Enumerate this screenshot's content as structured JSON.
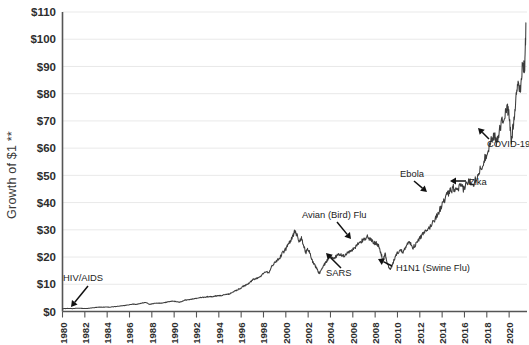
{
  "chart_data": {
    "type": "line",
    "title": "",
    "xlabel": "",
    "ylabel": "Growth of $1 **",
    "xlim": [
      1980,
      2021.6
    ],
    "ylim": [
      0,
      110
    ],
    "grid": true,
    "legend": "none",
    "y_tick_labels": [
      "$0",
      "$10",
      "$20",
      "$30",
      "$40",
      "$50",
      "$60",
      "$70",
      "$80",
      "$90",
      "$100",
      "$110"
    ],
    "y_tick_values": [
      0,
      10,
      20,
      30,
      40,
      50,
      60,
      70,
      80,
      90,
      100,
      110
    ],
    "x_tick_labels": [
      "1980",
      "1982",
      "1984",
      "1986",
      "1988",
      "1990",
      "1992",
      "1994",
      "1996",
      "1998",
      "2000",
      "2002",
      "2004",
      "2006",
      "2008",
      "2010",
      "2012",
      "2014",
      "2016",
      "2018",
      "2020"
    ],
    "x_tick_values": [
      1980,
      1982,
      1984,
      1986,
      1988,
      1990,
      1992,
      1994,
      1996,
      1998,
      2000,
      2002,
      2004,
      2006,
      2008,
      2010,
      2012,
      2014,
      2016,
      2018,
      2020
    ],
    "series": [
      {
        "name": "Growth of $1",
        "x": [
          1980.0,
          1980.3,
          1980.6,
          1980.9,
          1981.2,
          1981.5,
          1981.8,
          1982.1,
          1982.4,
          1982.7,
          1983.0,
          1983.3,
          1983.6,
          1983.9,
          1984.2,
          1984.5,
          1984.8,
          1985.1,
          1985.4,
          1985.7,
          1986.0,
          1986.3,
          1986.6,
          1986.9,
          1987.2,
          1987.5,
          1987.8,
          1988.0,
          1988.3,
          1988.6,
          1988.9,
          1989.2,
          1989.5,
          1989.8,
          1990.1,
          1990.4,
          1990.7,
          1991.0,
          1991.3,
          1991.6,
          1991.9,
          1992.2,
          1992.5,
          1992.8,
          1993.1,
          1993.4,
          1993.7,
          1994.0,
          1994.3,
          1994.6,
          1994.9,
          1995.2,
          1995.5,
          1995.8,
          1996.1,
          1996.4,
          1996.7,
          1997.0,
          1997.3,
          1997.6,
          1997.9,
          1998.2,
          1998.5,
          1998.8,
          1999.1,
          1999.4,
          1999.7,
          2000.0,
          2000.2,
          2000.4,
          2000.6,
          2000.8,
          2001.0,
          2001.2,
          2001.4,
          2001.6,
          2001.8,
          2002.0,
          2002.2,
          2002.4,
          2002.6,
          2002.8,
          2003.0,
          2003.2,
          2003.4,
          2003.6,
          2003.8,
          2004.0,
          2004.3,
          2004.6,
          2004.9,
          2005.2,
          2005.5,
          2005.8,
          2006.1,
          2006.4,
          2006.7,
          2007.0,
          2007.3,
          2007.6,
          2007.9,
          2008.1,
          2008.3,
          2008.5,
          2008.7,
          2008.9,
          2009.1,
          2009.3,
          2009.5,
          2009.7,
          2009.9,
          2010.2,
          2010.5,
          2010.8,
          2011.1,
          2011.4,
          2011.7,
          2012.0,
          2012.3,
          2012.6,
          2012.9,
          2013.2,
          2013.5,
          2013.8,
          2014.1,
          2014.4,
          2014.7,
          2015.0,
          2015.3,
          2015.6,
          2015.9,
          2016.2,
          2016.5,
          2016.8,
          2017.1,
          2017.4,
          2017.7,
          2018.0,
          2018.3,
          2018.6,
          2018.9,
          2019.2,
          2019.5,
          2019.8,
          2020.0,
          2020.2,
          2020.4,
          2020.6,
          2020.8,
          2021.0,
          2021.2,
          2021.4,
          2021.5
        ],
        "y": [
          1.0,
          1.1,
          1.15,
          1.05,
          1.2,
          1.2,
          1.15,
          1.1,
          1.2,
          1.35,
          1.5,
          1.6,
          1.6,
          1.65,
          1.6,
          1.7,
          1.85,
          2.0,
          2.1,
          2.3,
          2.5,
          2.7,
          2.6,
          2.8,
          3.2,
          3.3,
          2.6,
          2.8,
          3.0,
          3.1,
          3.0,
          3.3,
          3.6,
          3.8,
          3.7,
          3.4,
          3.7,
          4.2,
          4.3,
          4.5,
          4.8,
          5.0,
          5.1,
          5.3,
          5.5,
          5.4,
          5.7,
          5.8,
          5.9,
          6.2,
          6.4,
          7.0,
          7.6,
          8.2,
          9.0,
          9.6,
          10.3,
          11.5,
          12.2,
          12.6,
          13.6,
          14.8,
          14.2,
          17.0,
          18.5,
          19.3,
          21.5,
          23.0,
          24.5,
          26.0,
          27.5,
          29.5,
          28.0,
          25.5,
          27.0,
          24.0,
          21.5,
          23.0,
          21.0,
          18.5,
          17.0,
          15.5,
          14.0,
          15.5,
          17.0,
          18.0,
          19.5,
          20.0,
          19.5,
          20.5,
          21.0,
          20.5,
          21.5,
          22.0,
          23.0,
          24.5,
          25.5,
          26.5,
          27.5,
          26.5,
          25.0,
          25.5,
          24.0,
          21.5,
          19.0,
          21.0,
          17.5,
          15.5,
          16.5,
          19.0,
          21.0,
          22.5,
          22.0,
          24.5,
          25.5,
          23.5,
          25.0,
          27.0,
          28.5,
          29.5,
          31.0,
          33.0,
          35.0,
          37.5,
          40.0,
          42.5,
          44.0,
          45.5,
          44.0,
          46.0,
          45.0,
          47.0,
          48.0,
          47.0,
          49.5,
          52.0,
          55.0,
          58.0,
          62.0,
          65.0,
          62.0,
          68.0,
          71.0,
          75.0,
          72.0,
          62.0,
          70.0,
          78.0,
          85.0,
          80.0,
          92.0,
          88.0,
          106.0
        ]
      }
    ],
    "annotations": [
      {
        "label": "HIV/AIDS",
        "text_x": 63,
        "text_y": 281,
        "arrow_x1": 88,
        "arrow_y1": 286,
        "arrow_x2": 71,
        "arrow_y2": 307
      },
      {
        "label": "SARS",
        "text_x": 326,
        "text_y": 276,
        "arrow_x1": 341,
        "arrow_y1": 268,
        "arrow_x2": 326,
        "arrow_y2": 253
      },
      {
        "label": "Avian (Bird) Flu",
        "text_x": 302,
        "text_y": 218,
        "arrow_x1": 337,
        "arrow_y1": 222,
        "arrow_x2": 351,
        "arrow_y2": 239
      },
      {
        "label": "H1N1 (Swine Flu)",
        "text_x": 396,
        "text_y": 271,
        "arrow_x1": 392,
        "arrow_y1": 266,
        "arrow_x2": 378,
        "arrow_y2": 259
      },
      {
        "label": "Ebola",
        "text_x": 400,
        "text_y": 177,
        "arrow_x1": 414,
        "arrow_y1": 181,
        "arrow_x2": 427,
        "arrow_y2": 192
      },
      {
        "label": "Zika",
        "text_x": 469,
        "text_y": 185,
        "arrow_x1": 466,
        "arrow_y1": 181,
        "arrow_x2": 450,
        "arrow_y2": 181
      },
      {
        "label": "COVID-19",
        "text_x": 487,
        "text_y": 147,
        "arrow_x1": 489,
        "arrow_y1": 139,
        "arrow_x2": 478,
        "arrow_y2": 128
      }
    ]
  },
  "colors": {
    "line": "#3c3c3c",
    "grid": "#e9e9e9",
    "axis": "#555555",
    "text": "#2e2e2e",
    "background": "#ffffff"
  }
}
